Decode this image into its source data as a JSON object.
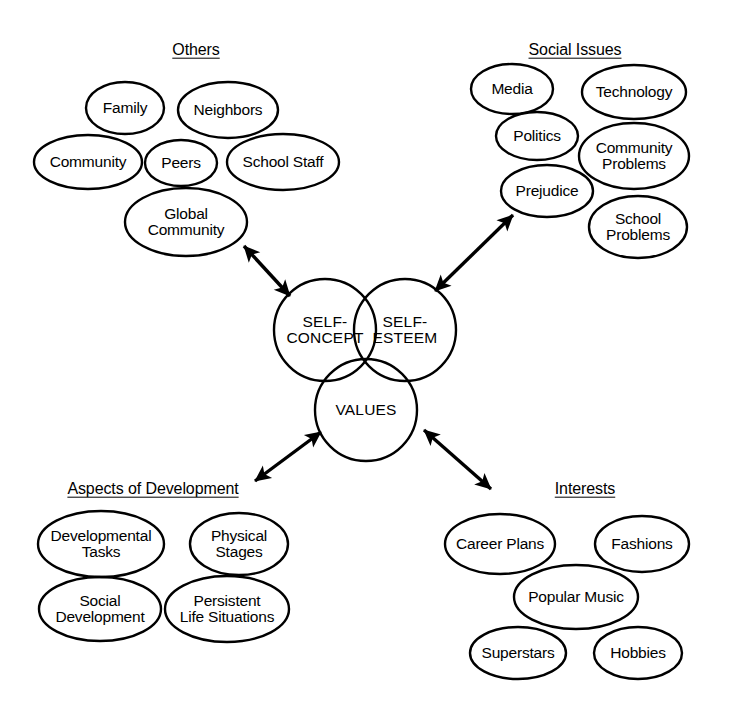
{
  "diagram": {
    "type": "concept-map",
    "background_color": "#ffffff",
    "stroke_color": "#000000",
    "core": {
      "shape": "venn-three-circle",
      "circles": [
        {
          "id": "self-concept",
          "label": "SELF-\nCONCEPT",
          "cx": 325,
          "cy": 330,
          "r": 51
        },
        {
          "id": "self-esteem",
          "label": "SELF-\nESTEEM",
          "cx": 405,
          "cy": 330,
          "r": 51
        },
        {
          "id": "values",
          "label": "VALUES",
          "cx": 366,
          "cy": 410,
          "r": 51
        }
      ]
    },
    "clusters": [
      {
        "id": "others",
        "title": "Others",
        "title_x": 196,
        "title_y": 50,
        "nodes": [
          {
            "label": "Family",
            "cx": 125,
            "cy": 108,
            "rx": 39,
            "ry": 26
          },
          {
            "label": "Neighbors",
            "cx": 228,
            "cy": 110,
            "rx": 50,
            "ry": 28
          },
          {
            "label": "Community",
            "cx": 88,
            "cy": 162,
            "rx": 54,
            "ry": 27
          },
          {
            "label": "Peers",
            "cx": 181,
            "cy": 163,
            "rx": 36,
            "ry": 23
          },
          {
            "label": "School Staff",
            "cx": 283,
            "cy": 162,
            "rx": 56,
            "ry": 28
          },
          {
            "label": "Global\nCommunity",
            "cx": 186,
            "cy": 222,
            "rx": 61,
            "ry": 34
          }
        ]
      },
      {
        "id": "social-issues",
        "title": "Social Issues",
        "title_x": 575,
        "title_y": 50,
        "nodes": [
          {
            "label": "Media",
            "cx": 512,
            "cy": 89,
            "rx": 41,
            "ry": 25
          },
          {
            "label": "Technology",
            "cx": 634,
            "cy": 92,
            "rx": 52,
            "ry": 27
          },
          {
            "label": "Politics",
            "cx": 537,
            "cy": 136,
            "rx": 41,
            "ry": 24
          },
          {
            "label": "Community\nProblems",
            "cx": 634,
            "cy": 156,
            "rx": 55,
            "ry": 33
          },
          {
            "label": "Prejudice",
            "cx": 547,
            "cy": 191,
            "rx": 46,
            "ry": 26
          },
          {
            "label": "School\nProblems",
            "cx": 638,
            "cy": 227,
            "rx": 49,
            "ry": 31
          }
        ]
      },
      {
        "id": "aspects-of-development",
        "title": "Aspects of Development",
        "title_x": 153,
        "title_y": 489,
        "nodes": [
          {
            "label": "Developmental\nTasks",
            "cx": 101,
            "cy": 544,
            "rx": 63,
            "ry": 33
          },
          {
            "label": "Physical\nStages",
            "cx": 239,
            "cy": 544,
            "rx": 49,
            "ry": 31
          },
          {
            "label": "Social\nDevelopment",
            "cx": 100,
            "cy": 609,
            "rx": 61,
            "ry": 32
          },
          {
            "label": "Persistent\nLife Situations",
            "cx": 227,
            "cy": 609,
            "rx": 62,
            "ry": 33
          }
        ]
      },
      {
        "id": "interests",
        "title": "Interests",
        "title_x": 585,
        "title_y": 489,
        "nodes": [
          {
            "label": "Career Plans",
            "cx": 500,
            "cy": 544,
            "rx": 55,
            "ry": 30
          },
          {
            "label": "Fashions",
            "cx": 642,
            "cy": 544,
            "rx": 47,
            "ry": 28
          },
          {
            "label": "Popular Music",
            "cx": 576,
            "cy": 597,
            "rx": 62,
            "ry": 32
          },
          {
            "label": "Superstars",
            "cx": 518,
            "cy": 653,
            "rx": 48,
            "ry": 26
          },
          {
            "label": "Hobbies",
            "cx": 638,
            "cy": 653,
            "rx": 44,
            "ry": 26
          }
        ]
      }
    ],
    "connectors": [
      {
        "id": "arrow-others",
        "from": "others-cluster",
        "to": "self-concept",
        "x1": 244,
        "y1": 246,
        "x2": 290,
        "y2": 296,
        "double_headed": true
      },
      {
        "id": "arrow-social-issues",
        "from": "self-esteem",
        "to": "social-issues-cluster",
        "x1": 435,
        "y1": 291,
        "x2": 513,
        "y2": 215,
        "double_headed": true
      },
      {
        "id": "arrow-aspects",
        "from": "values",
        "to": "aspects-of-development-cluster",
        "x1": 321,
        "y1": 432,
        "x2": 255,
        "y2": 481,
        "double_headed": true
      },
      {
        "id": "arrow-interests",
        "from": "values",
        "to": "interests-cluster",
        "x1": 424,
        "y1": 430,
        "x2": 491,
        "y2": 489,
        "double_headed": true
      }
    ]
  }
}
